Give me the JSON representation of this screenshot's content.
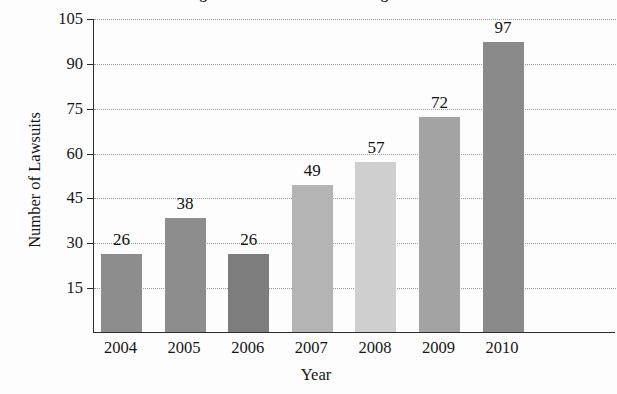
{
  "chart_data": {
    "type": "bar",
    "title": "Changes in Lawsuits Filed During the Years",
    "xlabel": "Year",
    "ylabel": "Number of Lawsuits",
    "categories": [
      "2004",
      "2005",
      "2006",
      "2007",
      "2008",
      "2009",
      "2010"
    ],
    "values": [
      26,
      38,
      26,
      49,
      57,
      72,
      97
    ],
    "value_labels": [
      "26",
      "38",
      "26",
      "49",
      "57",
      "72",
      "97"
    ],
    "ylim": [
      0,
      105
    ],
    "yticks": [
      15,
      30,
      45,
      60,
      75,
      90,
      105
    ],
    "ytick_labels": [
      "15",
      "30",
      "45",
      "60",
      "75",
      "90",
      "105"
    ],
    "grid": true,
    "grid_style": "dotted-horizontal",
    "legend": "none",
    "bar_colors": [
      "#8d8d8d",
      "#8d8d8d",
      "#7d7d7d",
      "#b4b4b4",
      "#cfcfcf",
      "#a3a3a3",
      "#8a8a8a"
    ],
    "axis_color": "#2b2b2b",
    "grid_color": "#9a9a9a",
    "background": "#fdfdfd"
  }
}
